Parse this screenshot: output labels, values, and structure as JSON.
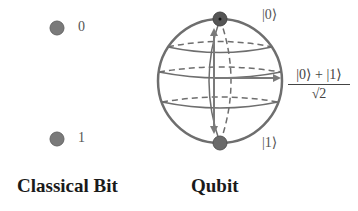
{
  "classical_bit": {
    "caption": "Classical Bit",
    "states": [
      {
        "label": "0"
      },
      {
        "label": "1"
      }
    ]
  },
  "qubit": {
    "caption": "Qubit",
    "top_state": "|0⟩",
    "bottom_state": "|1⟩",
    "superposition": {
      "numerator": "|0⟩ + |1⟩",
      "denominator": "√2"
    }
  },
  "colors": {
    "point_fill": "#7a7a7a",
    "sphere_stroke": "#6e6e6e",
    "text": "#1a1a1a"
  }
}
